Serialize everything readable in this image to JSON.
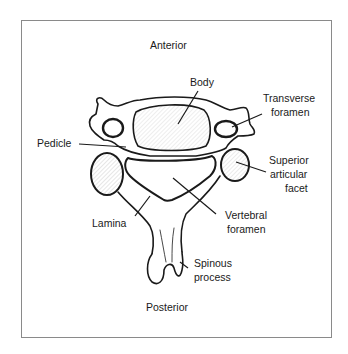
{
  "diagram": {
    "type": "anatomical-illustration",
    "orientation": {
      "top": "Anterior",
      "bottom": "Posterior"
    },
    "labels": {
      "anterior": "Anterior",
      "posterior": "Posterior",
      "body": "Body",
      "transverse_foramen_1": "Transverse",
      "transverse_foramen_2": "foramen",
      "pedicle": "Pedicle",
      "superior_articular_facet_1": "Superior",
      "superior_articular_facet_2": "articular",
      "superior_articular_facet_3": "facet",
      "lamina": "Lamina",
      "vertebral_foramen_1": "Vertebral",
      "vertebral_foramen_2": "foramen",
      "spinous_process_1": "Spinous",
      "spinous_process_2": "process"
    },
    "colors": {
      "ink": "#1a1a1a",
      "frame": "#8a8a8a",
      "background": "#ffffff"
    }
  }
}
